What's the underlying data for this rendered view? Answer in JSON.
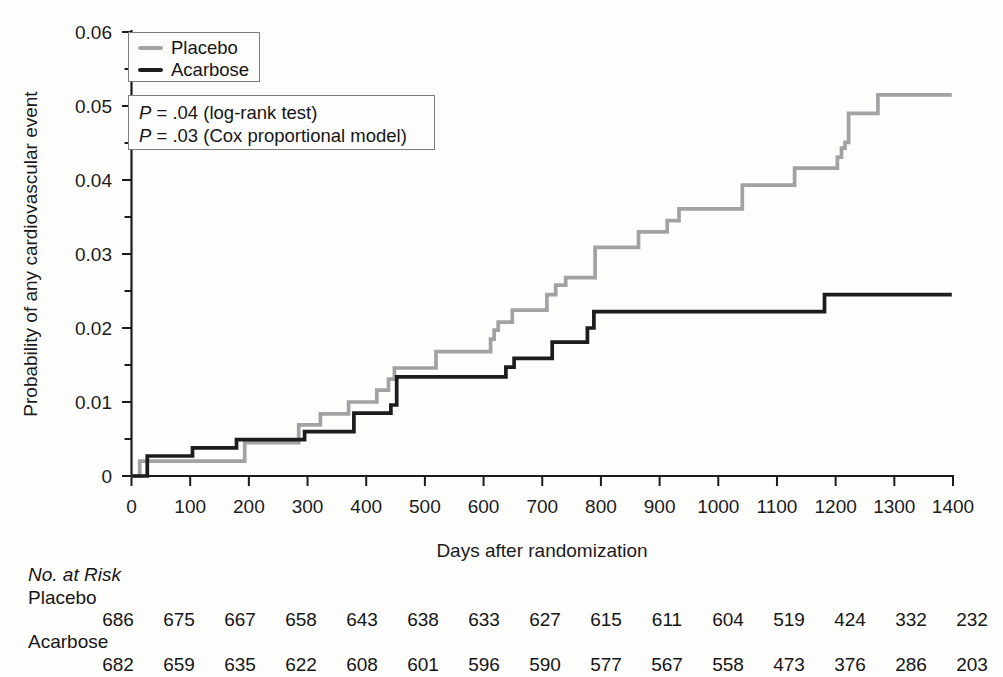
{
  "chart_data": {
    "type": "line",
    "line_style": "step",
    "title": "",
    "xlabel": "Days after randomization",
    "ylabel": "Probability of any cardiovascular event",
    "xlim": [
      0,
      1400
    ],
    "ylim": [
      0,
      0.06
    ],
    "grid": false,
    "x_ticks": [
      0,
      100,
      200,
      300,
      400,
      500,
      600,
      700,
      800,
      900,
      1000,
      1100,
      1200,
      1300,
      1400
    ],
    "y_ticks": [
      {
        "value": 0,
        "label": "0"
      },
      {
        "value": 0.01,
        "label": "0.01"
      },
      {
        "value": 0.02,
        "label": "0.02"
      },
      {
        "value": 0.03,
        "label": "0.03"
      },
      {
        "value": 0.04,
        "label": "0.04"
      },
      {
        "value": 0.05,
        "label": "0.05"
      },
      {
        "value": 0.06,
        "label": "0.06"
      }
    ],
    "y_minor_ticks": [
      0.005,
      0.015,
      0.025,
      0.035,
      0.045,
      0.055
    ],
    "legend_position": "top-left",
    "legend": [
      {
        "label": "Placebo",
        "color": "#a2a2a2"
      },
      {
        "label": "Acarbose",
        "color": "#1c1c1c"
      }
    ],
    "annotations": [
      {
        "symbol": "P",
        "text": " = .04 (log-rank test)"
      },
      {
        "symbol": "P",
        "text": " = .03 (Cox proportional model)"
      }
    ],
    "series": [
      {
        "name": "Placebo",
        "color": "#a2a2a2",
        "x_end": 1398,
        "points": [
          [
            0,
            0
          ],
          [
            14,
            0.002
          ],
          [
            193,
            0.0045
          ],
          [
            285,
            0.0069
          ],
          [
            322,
            0.0084
          ],
          [
            370,
            0.01
          ],
          [
            418,
            0.0116
          ],
          [
            438,
            0.0131
          ],
          [
            448,
            0.0146
          ],
          [
            519,
            0.0168
          ],
          [
            612,
            0.0185
          ],
          [
            618,
            0.0197
          ],
          [
            625,
            0.0208
          ],
          [
            649,
            0.0224
          ],
          [
            708,
            0.0245
          ],
          [
            723,
            0.0258
          ],
          [
            740,
            0.0268
          ],
          [
            790,
            0.0309
          ],
          [
            864,
            0.033
          ],
          [
            913,
            0.0345
          ],
          [
            933,
            0.0361
          ],
          [
            1041,
            0.0393
          ],
          [
            1130,
            0.0416
          ],
          [
            1203,
            0.0431
          ],
          [
            1210,
            0.0443
          ],
          [
            1216,
            0.0451
          ],
          [
            1222,
            0.049
          ],
          [
            1272,
            0.0515
          ]
        ]
      },
      {
        "name": "Acarbose",
        "color": "#1c1c1c",
        "x_end": 1398,
        "points": [
          [
            0,
            0
          ],
          [
            27,
            0.0027
          ],
          [
            104,
            0.0038
          ],
          [
            179,
            0.0049
          ],
          [
            295,
            0.006
          ],
          [
            379,
            0.0085
          ],
          [
            442,
            0.0096
          ],
          [
            452,
            0.0134
          ],
          [
            638,
            0.0147
          ],
          [
            652,
            0.0159
          ],
          [
            717,
            0.0181
          ],
          [
            777,
            0.02
          ],
          [
            788,
            0.0222
          ],
          [
            1181,
            0.0245
          ]
        ]
      }
    ]
  },
  "risk_table": {
    "title": "No. at Risk",
    "rows": [
      {
        "label": "Placebo",
        "values": [
          686,
          675,
          667,
          658,
          643,
          638,
          633,
          627,
          615,
          611,
          604,
          519,
          424,
          332,
          232
        ]
      },
      {
        "label": "Acarbose",
        "values": [
          682,
          659,
          635,
          622,
          608,
          601,
          596,
          590,
          577,
          567,
          558,
          473,
          376,
          286,
          203
        ]
      }
    ]
  }
}
